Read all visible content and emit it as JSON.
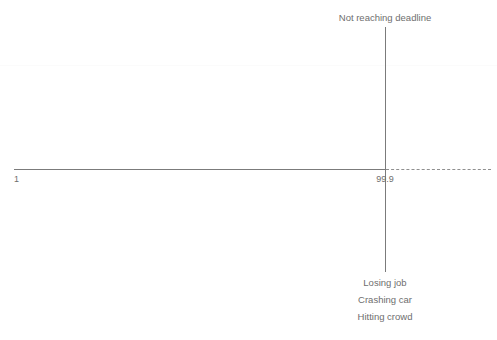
{
  "diagram": {
    "type": "annotated-axis",
    "background_color": "#ffffff",
    "line_color": "#7b7b7b",
    "text_color": "#6e6e6e",
    "axis": {
      "scale_min_label": "1",
      "scale_max_label": "99.9",
      "solid_segment": true,
      "dashed_continuation": true
    },
    "threshold_marker": {
      "position_label": "99.9",
      "above_label": "Not reaching deadline",
      "below_labels": [
        "Losing job",
        "Crashing car",
        "Hitting crowd"
      ]
    }
  },
  "chart_data": {
    "type": "line",
    "title": "",
    "xlabel": "",
    "ylabel": "",
    "x_tick_labels": [
      "1",
      "99.9"
    ],
    "x_tick_positions": [
      1,
      99.9
    ],
    "xlim": [
      1,
      99.9
    ],
    "grid": false,
    "legend": null,
    "series": [
      {
        "name": "baseline-axis",
        "style": "solid",
        "x": [
          1,
          99.9
        ],
        "y": [
          0,
          0
        ]
      },
      {
        "name": "extrapolated-axis",
        "style": "dashed",
        "x": [
          99.9,
          128
        ],
        "y": [
          0,
          0
        ]
      },
      {
        "name": "threshold-divider",
        "style": "solid-vertical",
        "x": [
          99.9,
          99.9
        ],
        "y": [
          -1,
          1
        ]
      }
    ],
    "annotations": [
      {
        "text": "Not reaching deadline",
        "x": 99.9,
        "y": 1,
        "position": "above"
      },
      {
        "text": "99.9",
        "x": 99.9,
        "y": 0,
        "position": "below-axis"
      },
      {
        "text": "1",
        "x": 1,
        "y": 0,
        "position": "below-axis"
      },
      {
        "text": "Losing job",
        "x": 99.9,
        "y": -1,
        "position": "below"
      },
      {
        "text": "Crashing car",
        "x": 99.9,
        "y": -1.1,
        "position": "below"
      },
      {
        "text": "Hitting crowd",
        "x": 99.9,
        "y": -1.2,
        "position": "below"
      }
    ]
  }
}
